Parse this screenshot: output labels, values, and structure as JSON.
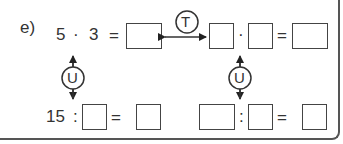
{
  "exercise": {
    "label": "e)",
    "top_row": {
      "left_operand": "5",
      "operator": "·",
      "right_operand": "3",
      "equals": "=",
      "right_operator": "·",
      "right_equals": "="
    },
    "bottom_row": {
      "left_operand": "15",
      "operator": ":",
      "equals": "=",
      "right_operator": ":",
      "right_equals": "="
    },
    "transform_label": "T",
    "inverse_label_left": "U",
    "inverse_label_right": "U"
  },
  "colors": {
    "text": "#333333",
    "border": "#444444",
    "frame": "#555555"
  }
}
